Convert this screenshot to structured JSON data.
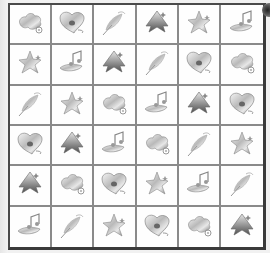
{
  "board": {
    "rows": 6,
    "cols": 6,
    "tiles": [
      [
        "cloud",
        "heart",
        "leaf",
        "diamond",
        "star",
        "music"
      ],
      [
        "star",
        "music",
        "diamond",
        "leaf",
        "heart",
        "cloud"
      ],
      [
        "leaf",
        "star",
        "cloud",
        "music",
        "diamond",
        "heart"
      ],
      [
        "heart",
        "diamond",
        "music",
        "cloud",
        "leaf",
        "star"
      ],
      [
        "diamond",
        "cloud",
        "heart",
        "star",
        "music",
        "leaf"
      ],
      [
        "music",
        "leaf",
        "star",
        "heart",
        "cloud",
        "diamond"
      ]
    ]
  },
  "icons": {
    "cloud": "cloud-icon",
    "heart": "heart-icon",
    "leaf": "leaf-icon",
    "diamond": "diamond-icon",
    "star": "star-icon",
    "music": "music-note-icon"
  },
  "colors": {
    "background": "#f1f1f1",
    "tile": "#fefefe",
    "grid_line": "#8a8a8a",
    "frame": "#4a4a4a",
    "icon_light": "#e2e2e2",
    "icon_mid": "#a8a8a8",
    "icon_dark": "#5a5a5a"
  }
}
